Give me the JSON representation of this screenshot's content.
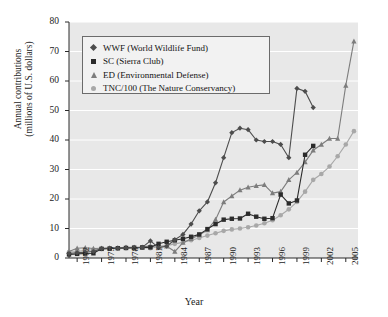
{
  "chart_data": {
    "type": "line",
    "title": "",
    "xlabel": "Year",
    "ylabel": "Annual contributions\n(millions of U.S. dollars)",
    "ylim": [
      0,
      80
    ],
    "xlim": [
      1971,
      2006.5
    ],
    "yticks": [
      0,
      10,
      20,
      30,
      40,
      50,
      60,
      70,
      80
    ],
    "xticks": [
      1972,
      1975,
      1978,
      1981,
      1984,
      1987,
      1990,
      1993,
      1996,
      1999,
      2002,
      2005
    ],
    "grid": "horizontal-white-on-gray",
    "legend_position": "upper-left-inside",
    "plot_bg": "#e8e8e8",
    "series": [
      {
        "name": "WWF (World Wildlife Fund)",
        "short": "WWF",
        "marker": "diamond",
        "color": "#4d4d4d",
        "x": [
          1971,
          1972,
          1973,
          1974,
          1975,
          1976,
          1977,
          1978,
          1979,
          1980,
          1981,
          1982,
          1983,
          1984,
          1985,
          1986,
          1987,
          1988,
          1989,
          1990,
          1991,
          1992,
          1993,
          1994,
          1995,
          1996,
          1997,
          1998,
          1999,
          2000,
          2001
        ],
        "y": [
          1.5,
          1.8,
          2.0,
          2.2,
          3.2,
          3.3,
          3.3,
          3.4,
          3.5,
          3.6,
          5.8,
          3.5,
          4.0,
          6.2,
          8.0,
          11.5,
          16.0,
          19.0,
          25.5,
          34.0,
          42.5,
          44.0,
          43.5,
          40.0,
          39.5,
          39.5,
          38.5,
          34.0,
          57.5,
          56.5,
          51.0
        ]
      },
      {
        "name": "SC (Sierra Club)",
        "short": "SC",
        "marker": "square",
        "color": "#2b2b2b",
        "x": [
          1971,
          1972,
          1973,
          1974,
          1975,
          1976,
          1977,
          1978,
          1979,
          1980,
          1981,
          1982,
          1983,
          1984,
          1985,
          1986,
          1987,
          1988,
          1989,
          1990,
          1991,
          1992,
          1993,
          1994,
          1995,
          1996,
          1997,
          1998,
          1999,
          2000,
          2001
        ],
        "y": [
          1.2,
          1.4,
          1.5,
          1.6,
          3.1,
          3.2,
          3.3,
          3.4,
          3.5,
          3.6,
          3.6,
          4.8,
          5.5,
          6.0,
          6.5,
          7.2,
          8.0,
          9.8,
          11.5,
          13.0,
          13.3,
          13.4,
          15.0,
          14.0,
          13.3,
          13.5,
          21.5,
          18.5,
          19.5,
          35.0,
          38.0
        ]
      },
      {
        "name": "ED (Environmental Defense)",
        "short": "ED",
        "marker": "triangle",
        "color": "#7d7d7d",
        "x": [
          1971,
          1972,
          1973,
          1974,
          1975,
          1976,
          1977,
          1978,
          1979,
          1980,
          1981,
          1982,
          1983,
          1984,
          1985,
          1986,
          1987,
          1988,
          1989,
          1990,
          1991,
          1992,
          1993,
          1994,
          1995,
          1996,
          1997,
          1998,
          1999,
          2000,
          2001,
          2002,
          2003,
          2004,
          2005,
          2006
        ],
        "y": [
          2.2,
          3.3,
          3.5,
          3.2,
          3.3,
          3.4,
          3.5,
          3.6,
          3.6,
          3.6,
          4.2,
          4.0,
          4.0,
          2.2,
          5.2,
          6.5,
          7.8,
          9.5,
          13.0,
          19.0,
          21.0,
          23.0,
          24.0,
          24.5,
          24.8,
          22.0,
          22.5,
          26.5,
          29.0,
          32.5,
          36.5,
          38.5,
          40.5,
          40.5,
          58.5,
          73.5
        ]
      },
      {
        "name": "TNC/100 (The Nature Conservancy)",
        "short": "TNC/100",
        "marker": "circle",
        "color": "#a8a8a8",
        "x": [
          1971,
          1972,
          1973,
          1974,
          1975,
          1976,
          1977,
          1978,
          1979,
          1980,
          1981,
          1982,
          1983,
          1984,
          1985,
          1986,
          1987,
          1988,
          1989,
          1990,
          1991,
          1992,
          1993,
          1994,
          1995,
          1996,
          1997,
          1998,
          1999,
          2000,
          2001,
          2002,
          2003,
          2004,
          2005,
          2006
        ],
        "y": [
          2.0,
          2.2,
          2.6,
          2.8,
          3.1,
          3.2,
          3.3,
          3.4,
          3.5,
          3.5,
          3.3,
          3.8,
          4.2,
          4.8,
          5.3,
          6.0,
          6.8,
          7.6,
          8.4,
          9.2,
          9.7,
          10.0,
          10.4,
          11.0,
          11.8,
          12.8,
          14.5,
          16.5,
          19.0,
          22.5,
          26.5,
          28.5,
          31.0,
          34.5,
          38.5,
          43.0
        ]
      }
    ]
  },
  "axes": {
    "x_tick_labels": [
      "1972",
      "1975",
      "1978",
      "1981",
      "1984",
      "1987",
      "1990",
      "1993",
      "1996",
      "1999",
      "2002",
      "2005"
    ],
    "y_tick_labels": [
      "0",
      "10",
      "20",
      "30",
      "40",
      "50",
      "60",
      "70",
      "80"
    ],
    "x_title": "Year",
    "y_title_line1": "Annual contributions",
    "y_title_line2": "(millions of U.S. dollars)"
  },
  "legend": {
    "entries": [
      {
        "label": "WWF (World Wildlife Fund)",
        "marker": "diamond-marker"
      },
      {
        "label": "SC (Sierra Club)",
        "marker": "square-marker"
      },
      {
        "label": "ED (Environmental Defense)",
        "marker": "triangle-marker"
      },
      {
        "label": "TNC/100 (The Nature Conservancy)",
        "marker": "circle-marker"
      }
    ]
  }
}
